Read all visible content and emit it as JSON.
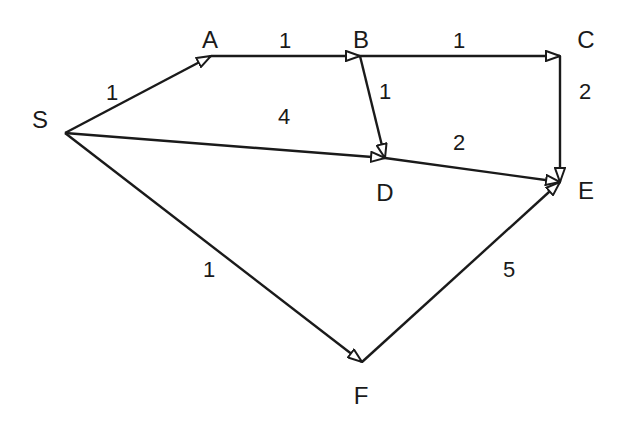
{
  "diagram": {
    "type": "directed-weighted-graph",
    "background": "#ffffff",
    "stroke_color": "#1a1a1a",
    "nodes": [
      {
        "id": "S",
        "label": "S",
        "x": 65,
        "y": 133,
        "label_x": 40,
        "label_y": 128
      },
      {
        "id": "A",
        "label": "A",
        "x": 211,
        "y": 56,
        "label_x": 210,
        "label_y": 48
      },
      {
        "id": "B",
        "label": "B",
        "x": 360,
        "y": 56,
        "label_x": 361,
        "label_y": 48
      },
      {
        "id": "C",
        "label": "C",
        "x": 560,
        "y": 56,
        "label_x": 586,
        "label_y": 48
      },
      {
        "id": "D",
        "label": "D",
        "x": 385,
        "y": 158,
        "label_x": 385,
        "label_y": 201
      },
      {
        "id": "E",
        "label": "E",
        "x": 560,
        "y": 182,
        "label_x": 586,
        "label_y": 199
      },
      {
        "id": "F",
        "label": "F",
        "x": 362,
        "y": 362,
        "label_x": 361,
        "label_y": 404
      }
    ],
    "edges": [
      {
        "from": "S",
        "to": "A",
        "weight": "1",
        "label_x": 112,
        "label_y": 100
      },
      {
        "from": "A",
        "to": "B",
        "weight": "1",
        "label_x": 285,
        "label_y": 48
      },
      {
        "from": "B",
        "to": "C",
        "weight": "1",
        "label_x": 459,
        "label_y": 48
      },
      {
        "from": "B",
        "to": "D",
        "weight": "1",
        "label_x": 385,
        "label_y": 99
      },
      {
        "from": "S",
        "to": "D",
        "weight": "4",
        "label_x": 284,
        "label_y": 124
      },
      {
        "from": "C",
        "to": "E",
        "weight": "2",
        "label_x": 585,
        "label_y": 99
      },
      {
        "from": "D",
        "to": "E",
        "weight": "2",
        "label_x": 459,
        "label_y": 150
      },
      {
        "from": "S",
        "to": "F",
        "weight": "1",
        "label_x": 209,
        "label_y": 277
      },
      {
        "from": "F",
        "to": "E",
        "weight": "5",
        "label_x": 509,
        "label_y": 277
      }
    ]
  }
}
